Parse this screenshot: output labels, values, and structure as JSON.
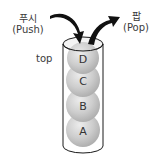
{
  "diagram": {
    "type": "stack",
    "push": {
      "korean": "푸시",
      "english": "(Push)"
    },
    "pop": {
      "korean": "팝",
      "english": "(Pop)"
    },
    "top_label": "top",
    "elements": [
      "D",
      "C",
      "B",
      "A"
    ],
    "colors": {
      "sphere": "#c8c8c8",
      "sphere_highlight": "#e6e6e6",
      "cylinder_stroke": "#1a1a1a",
      "arrow": "#111111"
    }
  }
}
